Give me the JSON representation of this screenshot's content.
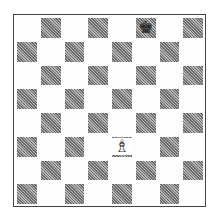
{
  "board": {
    "size": 8,
    "orientation": "white-bottom",
    "files": [
      "a",
      "b",
      "c",
      "d",
      "e",
      "f",
      "g",
      "h"
    ],
    "ranks": [
      8,
      7,
      6,
      5,
      4,
      3,
      2,
      1
    ],
    "colors": {
      "light": "#fdfdfd",
      "dark": "#8a8a8a",
      "border": "#444444"
    },
    "pieces": [
      {
        "square": "f8",
        "color": "black",
        "type": "king",
        "glyph": "♚"
      },
      {
        "square": "e3",
        "color": "white",
        "type": "bishop",
        "glyph": "♗"
      }
    ]
  }
}
